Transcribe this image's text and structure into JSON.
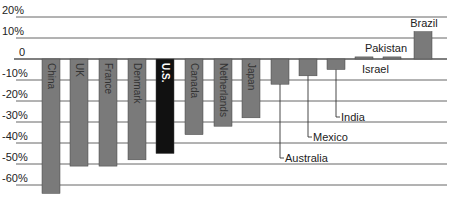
{
  "chart_data": {
    "type": "bar",
    "title": "",
    "xlabel": "",
    "ylabel": "",
    "ylim": [
      -65,
      20
    ],
    "grid": true,
    "y_ticks": [
      20,
      10,
      0,
      -10,
      -20,
      -30,
      -40,
      -50,
      -60
    ],
    "y_tick_labels": [
      "20%",
      "10%",
      "0",
      "-10%",
      "-20%",
      "-30%",
      "-40%",
      "-50%",
      "-60%"
    ],
    "categories": [
      "China",
      "UK",
      "France",
      "Denmark",
      "U.S.",
      "Canada",
      "Netherlands",
      "Japan",
      "Australia",
      "Mexico",
      "India",
      "Israel",
      "Pakistan",
      "Brazil"
    ],
    "values": [
      -64,
      -51,
      -51,
      -48,
      -45,
      -36,
      -32,
      -28,
      -12,
      -8,
      -5,
      1,
      1,
      13
    ],
    "highlight": "U.S.",
    "label_placement": [
      "inside",
      "inside",
      "inside",
      "inside",
      "inside",
      "inside",
      "inside",
      "inside",
      "callout",
      "callout",
      "callout",
      "beside",
      "above",
      "above"
    ],
    "colors": {
      "bar": "#7a7a7a",
      "highlight": "#111111",
      "grid": "#555555",
      "text": "#222222"
    }
  }
}
